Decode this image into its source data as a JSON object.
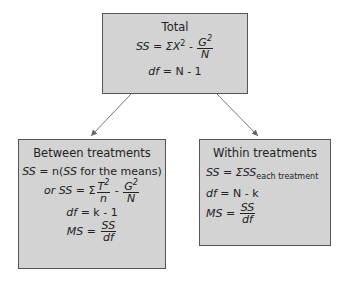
{
  "total": {
    "title": "Total",
    "ss_lhs": "SS",
    "ss_eq": " = ΣX",
    "ss_sq": "2",
    "minus": " - ",
    "g_num": "G",
    "g_sup": "2",
    "g_den": "N",
    "df_lhs": "df",
    "df_rhs": " = N - 1"
  },
  "between": {
    "title": "Between treatments",
    "ss1_lhs": "SS",
    "ss1_mid": " = n(",
    "ss1_inner": "SS",
    "ss1_tail": " for the means)",
    "or": "or ",
    "ss2_lhs": "SS",
    "ss2_eq": " = Σ",
    "t_num": "T",
    "t_sup": "2",
    "t_den": "n",
    "minus": " - ",
    "g_num": "G",
    "g_sup": "2",
    "g_den": "N",
    "df_lhs": "df",
    "df_rhs": " = k - 1",
    "ms_lhs": "MS",
    "ms_eq": " = ",
    "ms_num": "SS",
    "ms_den": "df"
  },
  "within": {
    "title": "Within treatments",
    "ss_lhs": "SS",
    "ss_eq": " = ΣSS",
    "ss_sub": "each treatment",
    "df_lhs": "df",
    "df_rhs": " = N - k",
    "ms_lhs": "MS",
    "ms_eq": " = ",
    "ms_num": "SS",
    "ms_den": "df"
  }
}
